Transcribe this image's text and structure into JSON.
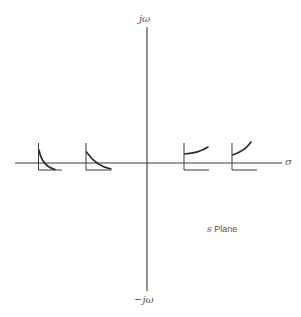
{
  "diagram": {
    "title": "s Plane",
    "plane_label": {
      "variable": "s",
      "text": "Plane"
    },
    "axes": {
      "horizontal_label": "σ",
      "vertical_top_label": "jω",
      "vertical_bottom_label": "−jω"
    },
    "impulse_responses": [
      {
        "position": "far-left real axis",
        "behavior": "fast decaying exponential"
      },
      {
        "position": "near-left real axis",
        "behavior": "slow decaying exponential"
      },
      {
        "position": "near-right real axis",
        "behavior": "slow growing exponential"
      },
      {
        "position": "far-right real axis",
        "behavior": "fast growing exponential"
      }
    ]
  }
}
